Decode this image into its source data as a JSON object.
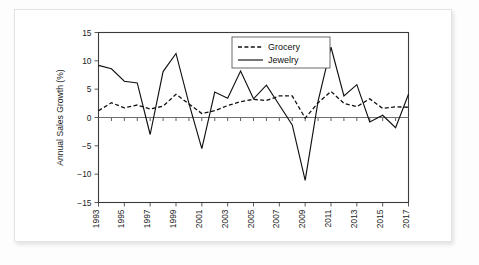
{
  "figure": {
    "background_color": "#ffffff",
    "frame_color": "#e3e3e3"
  },
  "chart_data": {
    "type": "line",
    "title": "",
    "xlabel": "",
    "ylabel": "Annual Sales Growth (%)",
    "ylim": [
      -15,
      15
    ],
    "yticks": [
      15,
      10,
      5,
      0,
      -5,
      -10,
      -15
    ],
    "ytick_labels": [
      "15",
      "10",
      "5",
      "0",
      "−5",
      "−10",
      "−15"
    ],
    "xlim": [
      1993,
      2017
    ],
    "xticks": [
      1993,
      1995,
      1997,
      1999,
      2001,
      2003,
      2005,
      2007,
      2009,
      2011,
      2013,
      2015,
      2017
    ],
    "xtick_labels": [
      "1993",
      "1995",
      "1997",
      "1999",
      "2001",
      "2003",
      "2005",
      "2007",
      "2009",
      "2011",
      "2013",
      "2015",
      "2017"
    ],
    "x": [
      1993,
      1994,
      1995,
      1996,
      1997,
      1998,
      1999,
      2000,
      2001,
      2002,
      2003,
      2004,
      2005,
      2006,
      2007,
      2008,
      2009,
      2010,
      2011,
      2012,
      2013,
      2014,
      2015,
      2016,
      2017
    ],
    "grid": false,
    "legend_position": "upper-center",
    "zero_line": true,
    "series": [
      {
        "name": "Grocery",
        "style": "dashed",
        "color": "#111111",
        "values": [
          1.2,
          2.6,
          1.7,
          2.2,
          1.5,
          2.0,
          4.1,
          2.4,
          0.7,
          1.2,
          2.1,
          2.8,
          3.2,
          3.0,
          3.8,
          3.8,
          -0.1,
          2.6,
          4.6,
          2.5,
          1.9,
          3.3,
          1.6,
          1.9,
          1.8
        ]
      },
      {
        "name": "Jewelry",
        "style": "solid",
        "color": "#111111",
        "values": [
          9.2,
          8.6,
          6.4,
          6.1,
          -3.0,
          8.1,
          11.3,
          2.5,
          -5.5,
          4.5,
          3.4,
          8.2,
          3.3,
          5.7,
          2.2,
          -1.3,
          -11.1,
          2.9,
          12.4,
          3.8,
          5.8,
          -0.8,
          0.4,
          -1.8,
          4.1
        ]
      }
    ]
  },
  "legend": {
    "items": [
      {
        "label": "Grocery",
        "style": "dashed"
      },
      {
        "label": "Jewelry",
        "style": "solid"
      }
    ]
  }
}
